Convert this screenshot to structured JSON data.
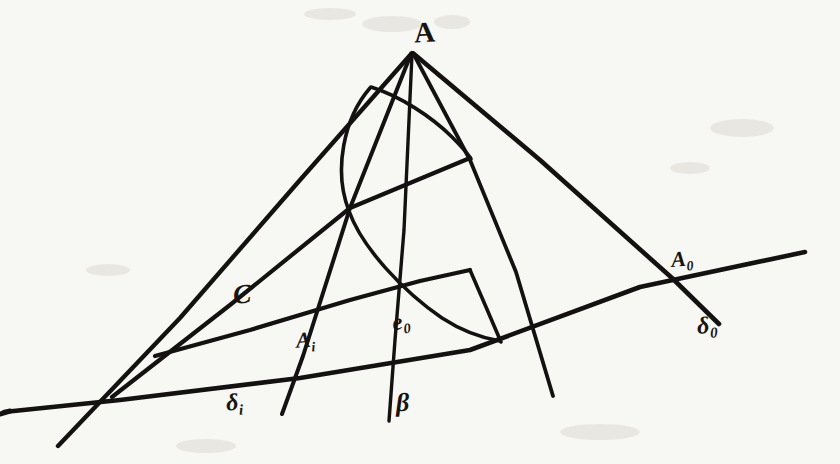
{
  "figure": {
    "kind": "hand-drawn-geometry-sketch",
    "ink_color": "#141210",
    "paper_color": "#f7f7f4",
    "width": 840,
    "height": 464
  },
  "labels": {
    "apex": "A",
    "chord": "C",
    "inner_point": {
      "base": "A",
      "sub": "i"
    },
    "conic_tangent": {
      "base": "e",
      "sub": "0"
    },
    "outer_point": {
      "base": "A",
      "sub": "0"
    },
    "base_line": {
      "base": "δ",
      "sub": "0"
    },
    "inner_line": {
      "base": "δ",
      "sub": "i"
    },
    "vertical_line": "β"
  },
  "geometry": {
    "points": {
      "A": [
        412,
        52
      ],
      "A_i": [
        303,
        356
      ],
      "A_0": [
        672,
        278
      ],
      "node_left": [
        350,
        208
      ],
      "node_right": [
        470,
        158
      ]
    },
    "strokes": [
      {
        "name": "base-line-delta-0",
        "type": "line",
        "d": "M 4 412 L 120 400 L 300 378 L 470 350 L 640 287 L 805 252"
      },
      {
        "name": "ray-A-to-lower-left",
        "type": "line",
        "d": "M 412 53 L 300 180 L 180 318 L 58 446"
      },
      {
        "name": "ray-A-through-C-node",
        "type": "line",
        "d": "M 411 54 L 350 208 L 303 356 L 282 414"
      },
      {
        "name": "ray-A-vertical-beta",
        "type": "line",
        "d": "M 412 54 L 404 230 L 395 340 L 389 421"
      },
      {
        "name": "ray-A-to-mid-right",
        "type": "line",
        "d": "M 413 53 L 470 160 L 516 272 L 553 396"
      },
      {
        "name": "ray-A-to-A0",
        "type": "line",
        "d": "M 414 54 L 540 160 L 672 278 L 719 324"
      },
      {
        "name": "chord-line-C",
        "type": "line",
        "d": "M 112 397 L 230 305 L 350 208 L 470 158"
      },
      {
        "name": "secant-line-through-nodes",
        "type": "line",
        "d": "M 155 356 L 250 330 L 350 300 L 420 280 L 470 270 L 501 342"
      },
      {
        "name": "conic-arc",
        "type": "curve",
        "d": "M 370 88 C 344 118, 333 170, 349 211 C 362 248, 404 292, 442 318 C 462 331, 482 338, 500 341"
      },
      {
        "name": "conic-arc-upper-tangent-chord",
        "type": "curve",
        "d": "M 371 87 C 400 96, 432 117, 452 137 C 462 147, 468 154, 471 159"
      }
    ]
  }
}
